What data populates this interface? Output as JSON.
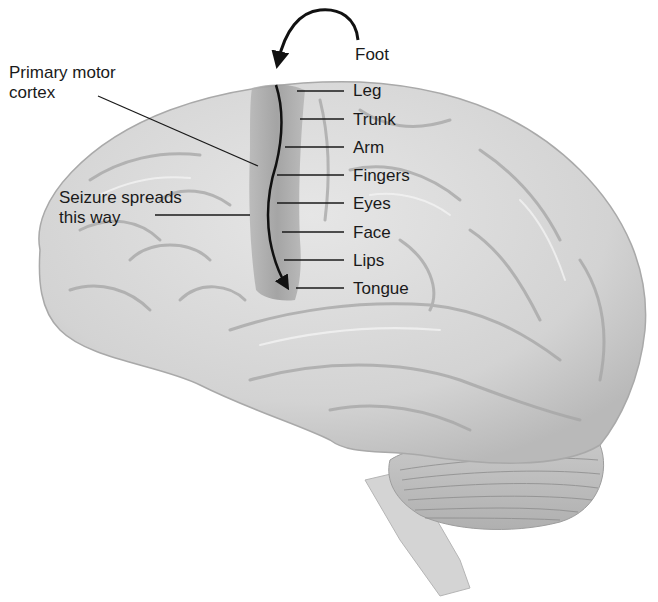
{
  "diagram": {
    "colors": {
      "background": "#ffffff",
      "brain_fill": "#d9d9d9",
      "brain_shadow": "#a8a8a8",
      "motor_cortex_fill": "#9e9e9e",
      "text": "#1a1a1a",
      "line": "#1a1a1a"
    },
    "left_labels": {
      "primary_motor_cortex": "Primary motor\ncortex",
      "seizure_spreads": "Seizure spreads\nthis way"
    },
    "body_map_labels": [
      {
        "label": "Foot"
      },
      {
        "label": "Leg"
      },
      {
        "label": "Trunk"
      },
      {
        "label": "Arm"
      },
      {
        "label": "Fingers"
      },
      {
        "label": "Eyes"
      },
      {
        "label": "Face"
      },
      {
        "label": "Lips"
      },
      {
        "label": "Tongue"
      }
    ],
    "regions": [
      "cerebrum",
      "primary-motor-cortex",
      "temporal-lobe",
      "cerebellum",
      "brainstem"
    ]
  }
}
